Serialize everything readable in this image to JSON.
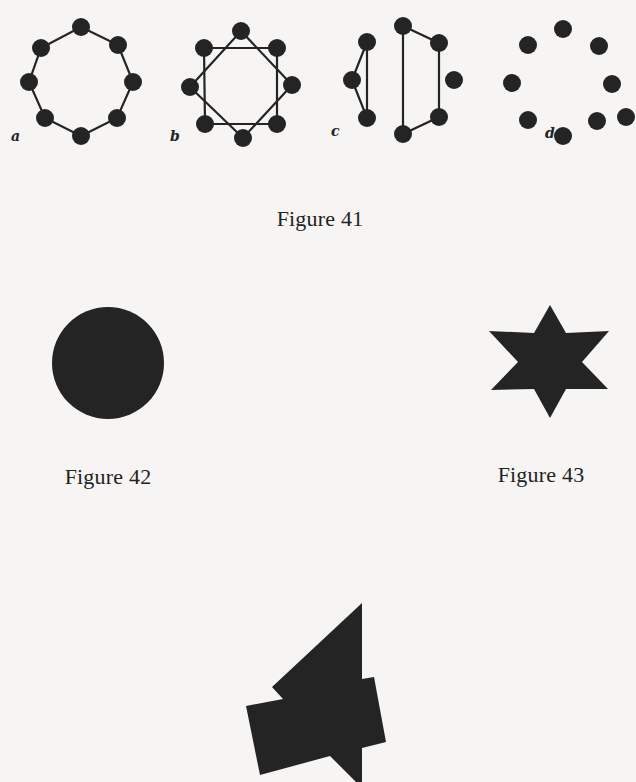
{
  "page": {
    "background": "#f6f5f3",
    "ink": "#242424"
  },
  "figure41": {
    "caption": "Figure 41",
    "panels": [
      {
        "label": "a",
        "description": "octagon of 8 dots joined in a single cycle"
      },
      {
        "label": "b",
        "description": "8 dots joined as two interlocking squares"
      },
      {
        "label": "c",
        "description": "8 dots: triangle, quadrilateral and one isolated dot"
      },
      {
        "label": "d",
        "description": "9 unconnected dots"
      }
    ]
  },
  "figure42": {
    "caption": "Figure 42",
    "description": "solid black disc"
  },
  "figure43": {
    "caption": "Figure 43",
    "description": "solid six-pointed star"
  },
  "figure44": {
    "description": "solid irregular shape: triangle overlapping a tilted rectangle"
  }
}
